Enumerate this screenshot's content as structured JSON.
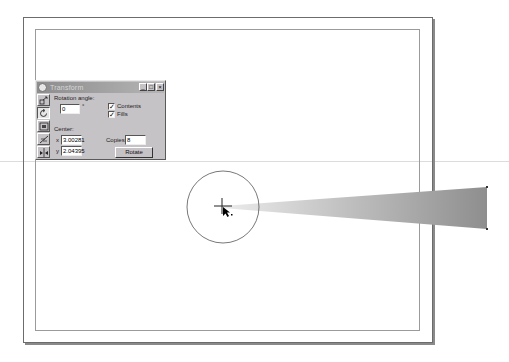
{
  "dialog": {
    "title": "Transform",
    "window_controls": {
      "minimize": "_",
      "maximize": "□",
      "close": "×"
    },
    "tools": [
      {
        "name": "position",
        "icon": "position-icon",
        "selected": false
      },
      {
        "name": "rotate",
        "icon": "rotate-icon",
        "selected": true
      },
      {
        "name": "scale",
        "icon": "scale-icon",
        "selected": false
      },
      {
        "name": "size",
        "icon": "size-icon",
        "selected": false
      },
      {
        "name": "skew",
        "icon": "skew-icon",
        "selected": false
      }
    ],
    "rotation_angle_label": "Rotation angle:",
    "rotation_angle_value": "0",
    "degree_symbol": "°",
    "contents_label": "Contents",
    "contents_checked": true,
    "fills_label": "Fills",
    "fills_checked": true,
    "center_label": "Center:",
    "x_label": "x",
    "x_value": "3.00281",
    "y_label": "y",
    "y_value": "2.04395",
    "copies_label": "Copies:",
    "copies_value": "8",
    "rotate_button": "Rotate",
    "check_mark": "✓"
  },
  "canvas": {
    "circle": {
      "cx": 223,
      "cy": 207,
      "r": 36,
      "stroke": "#555555"
    },
    "wedge": {
      "tip_x": 222,
      "tip_y": 206,
      "end_x": 487,
      "top_y": 187,
      "bottom_y": 229,
      "color_light": "#e4e4e4",
      "color_dark": "#8e8e8e"
    },
    "crosshair": {
      "x": 222,
      "y": 206
    }
  }
}
